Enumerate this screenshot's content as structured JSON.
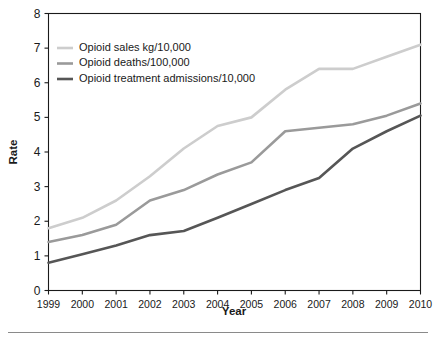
{
  "chart_data": {
    "type": "line",
    "title": "",
    "xlabel": "Year",
    "ylabel": "Rate",
    "x": [
      1999,
      2000,
      2001,
      2002,
      2003,
      2004,
      2005,
      2006,
      2007,
      2008,
      2009,
      2010
    ],
    "categories": [
      "1999",
      "2000",
      "2001",
      "2002",
      "2003",
      "2004",
      "2005",
      "2006",
      "2007",
      "2008",
      "2009",
      "2010"
    ],
    "xlim": [
      1999,
      2010
    ],
    "ylim": [
      0,
      8
    ],
    "yticks": [
      0,
      1,
      2,
      3,
      4,
      5,
      6,
      7,
      8
    ],
    "ytick_labels": [
      "0",
      "1",
      "2",
      "3",
      "4",
      "5",
      "6",
      "7",
      "8"
    ],
    "grid": false,
    "legend_position": "upper left",
    "series": [
      {
        "name": "Opioid sales kg/10,000",
        "color": "#cdcdcd",
        "values": [
          1.8,
          2.1,
          2.6,
          3.3,
          4.1,
          4.75,
          5.0,
          5.8,
          6.4,
          6.4,
          6.75,
          7.1
        ]
      },
      {
        "name": "Opioid deaths/100,000",
        "color": "#9a9a9a",
        "values": [
          1.4,
          1.6,
          1.9,
          2.6,
          2.9,
          3.35,
          3.7,
          4.6,
          4.7,
          4.8,
          5.05,
          5.4
        ]
      },
      {
        "name": "Opioid treatment admissions/10,000",
        "color": "#565656",
        "values": [
          0.8,
          1.05,
          1.3,
          1.6,
          1.72,
          2.1,
          2.5,
          2.9,
          3.25,
          4.1,
          4.6,
          5.05
        ]
      }
    ]
  },
  "axes": {
    "y_title": "Rate",
    "x_title": "Year"
  },
  "legend": {
    "entries": [
      {
        "label": "Opioid sales kg/10,000",
        "color": "#cdcdcd"
      },
      {
        "label": "Opioid deaths/100,000",
        "color": "#9a9a9a"
      },
      {
        "label": "Opioid treatment admissions/10,000",
        "color": "#565656"
      }
    ]
  }
}
